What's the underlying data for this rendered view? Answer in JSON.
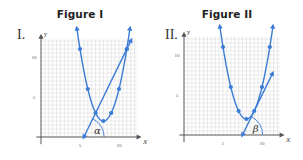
{
  "figures": [
    {
      "title": "Figure I",
      "roman": "I.",
      "angle_label": "α",
      "x_axis_label": "x",
      "y_axis_label": "y",
      "x_ticks": [
        "5",
        "10"
      ],
      "y_ticks": [
        "5",
        "10"
      ]
    },
    {
      "title": "Figure II",
      "roman": "II.",
      "angle_label": "β",
      "x_axis_label": "x",
      "y_axis_label": "y",
      "x_ticks": [
        "5",
        "10"
      ],
      "y_ticks": [
        "5",
        "10"
      ]
    }
  ],
  "colors": {
    "curve": "#3a7bd5",
    "grid": "#d6d6d6",
    "axis": "#555555",
    "text": "#222222"
  },
  "chart_data": [
    {
      "type": "line",
      "title": "Figure I",
      "xlabel": "x",
      "ylabel": "y",
      "xlim": [
        0,
        12
      ],
      "ylim": [
        0,
        12
      ],
      "grid": true,
      "x_ticks": [
        5,
        10
      ],
      "y_ticks": [
        5,
        10
      ],
      "series": [
        {
          "name": "parabola",
          "x": [
            5,
            6,
            7,
            8,
            9,
            10,
            11
          ],
          "y": [
            11,
            6,
            3,
            2,
            3,
            6,
            11
          ],
          "marker": "circle",
          "arrows": "both"
        },
        {
          "name": "secant line",
          "x": [
            5.5,
            7,
            11,
            11.6
          ],
          "y": [
            0,
            3,
            11,
            12.2
          ],
          "arrows": "both"
        }
      ],
      "annotations": [
        {
          "text": "α",
          "x": 5.5,
          "y": 0,
          "note": "angle between line and positive x-axis"
        }
      ]
    },
    {
      "type": "line",
      "title": "Figure II",
      "xlabel": "x",
      "ylabel": "y",
      "xlim": [
        0,
        12
      ],
      "ylim": [
        0,
        12
      ],
      "grid": true,
      "x_ticks": [
        5,
        10
      ],
      "y_ticks": [
        5,
        10
      ],
      "series": [
        {
          "name": "parabola",
          "x": [
            5,
            6,
            7,
            8,
            9,
            10,
            11
          ],
          "y": [
            11,
            6,
            3,
            2,
            3,
            6,
            11
          ],
          "marker": "circle",
          "arrows": "both"
        },
        {
          "name": "tangent line",
          "x": [
            7.5,
            9,
            11.4
          ],
          "y": [
            0,
            3,
            7.8
          ],
          "arrows": "both"
        }
      ],
      "annotations": [
        {
          "text": "β",
          "x": 7.5,
          "y": 0,
          "note": "angle between tangent line and positive x-axis"
        }
      ]
    }
  ]
}
